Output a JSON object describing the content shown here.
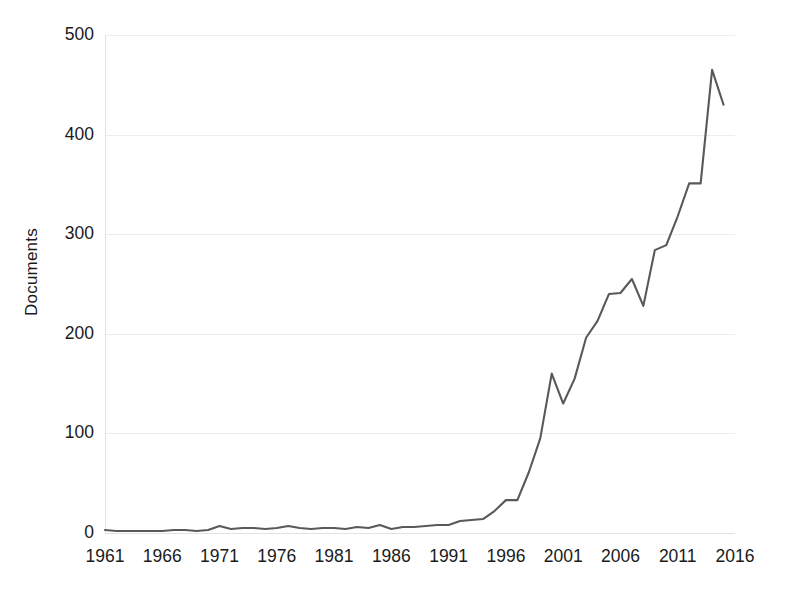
{
  "chart": {
    "type": "line",
    "title": "",
    "ylabel": "Documents",
    "xlabel": "",
    "line_color": "#595959",
    "grid": "horizontal",
    "legend": "none",
    "background": "#ffffff"
  },
  "axes": {
    "y_ticks": [
      "0",
      "100",
      "200",
      "300",
      "400",
      "500"
    ],
    "x_ticks": [
      "1961",
      "1966",
      "1971",
      "1976",
      "1981",
      "1986",
      "1991",
      "1996",
      "2001",
      "2006",
      "2011",
      "2016"
    ]
  },
  "chart_data": {
    "type": "line",
    "title": "",
    "xlabel": "",
    "ylabel": "Documents",
    "xlim": [
      1961,
      2016
    ],
    "ylim": [
      0,
      500
    ],
    "grid": true,
    "legend_position": "none",
    "x": [
      1961,
      1962,
      1963,
      1964,
      1965,
      1966,
      1967,
      1968,
      1969,
      1970,
      1971,
      1972,
      1973,
      1974,
      1975,
      1976,
      1977,
      1978,
      1979,
      1980,
      1981,
      1982,
      1983,
      1984,
      1985,
      1986,
      1987,
      1988,
      1989,
      1990,
      1991,
      1992,
      1993,
      1994,
      1995,
      1996,
      1997,
      1998,
      1999,
      2000,
      2001,
      2002,
      2003,
      2004,
      2005,
      2006,
      2007,
      2008,
      2009,
      2010,
      2011,
      2012,
      2013,
      2014,
      2015
    ],
    "series": [
      {
        "name": "Documents",
        "color": "#595959",
        "values": [
          3,
          2,
          2,
          2,
          2,
          2,
          3,
          3,
          2,
          3,
          7,
          4,
          5,
          5,
          4,
          5,
          7,
          5,
          4,
          5,
          5,
          4,
          6,
          5,
          8,
          4,
          6,
          6,
          7,
          8,
          8,
          12,
          13,
          14,
          22,
          33,
          33,
          61,
          95,
          160,
          130,
          155,
          196,
          213,
          240,
          241,
          255,
          228,
          284,
          289,
          318,
          351,
          351,
          465,
          430
        ]
      }
    ],
    "y_ticks": [
      0,
      100,
      200,
      300,
      400,
      500
    ],
    "x_ticks": [
      1961,
      1966,
      1971,
      1976,
      1981,
      1986,
      1991,
      1996,
      2001,
      2006,
      2011,
      2016
    ]
  }
}
